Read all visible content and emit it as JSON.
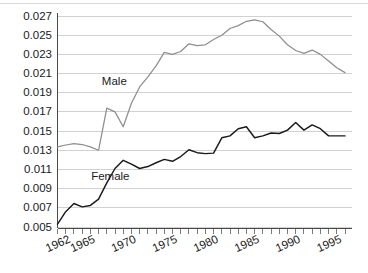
{
  "chart_data": {
    "type": "line",
    "title": "",
    "subtitle": "",
    "xlabel": "",
    "ylabel": "",
    "xlim": [
      1962,
      1997
    ],
    "ylim": [
      0.005,
      0.027
    ],
    "grid": true,
    "legend_position": "inline-annotation",
    "x_tick_labels": [
      "1962",
      "1965",
      "1970",
      "1975",
      "1980",
      "1985",
      "1990",
      "1995"
    ],
    "x_tick_values": [
      1962,
      1965,
      1970,
      1975,
      1980,
      1985,
      1990,
      1995
    ],
    "y_tick_labels": [
      "0.027",
      "0.025",
      "0.023",
      "0.021",
      "0.019",
      "0.017",
      "0.015",
      "0.013",
      "0.011",
      "0.009",
      "0.007",
      "0.005"
    ],
    "y_tick_values": [
      0.027,
      0.025,
      0.023,
      0.021,
      0.019,
      0.017,
      0.015,
      0.013,
      0.011,
      0.009,
      0.007,
      0.005
    ],
    "x": [
      1962,
      1963,
      1964,
      1965,
      1966,
      1967,
      1968,
      1969,
      1970,
      1971,
      1972,
      1973,
      1974,
      1975,
      1976,
      1977,
      1978,
      1979,
      1980,
      1981,
      1982,
      1983,
      1984,
      1985,
      1986,
      1987,
      1988,
      1989,
      1990,
      1991,
      1992,
      1993,
      1994,
      1995,
      1996,
      1997
    ],
    "series": [
      {
        "name": "Male",
        "color": "#8e8e8e",
        "label_x": 1967.4,
        "label_y": 0.0198,
        "values": [
          0.01335,
          0.01355,
          0.0137,
          0.0136,
          0.01335,
          0.013,
          0.0174,
          0.017,
          0.01545,
          0.0179,
          0.0196,
          0.02065,
          0.0218,
          0.0232,
          0.023,
          0.0233,
          0.0241,
          0.0239,
          0.024,
          0.02455,
          0.025,
          0.0257,
          0.026,
          0.02645,
          0.0266,
          0.0264,
          0.0256,
          0.0249,
          0.024,
          0.0234,
          0.0231,
          0.02345,
          0.023,
          0.0223,
          0.0216,
          0.0211
        ]
      },
      {
        "name": "Female",
        "color": "#1a1a1a",
        "label_x": 1966.1,
        "label_y": 0.00985,
        "values": [
          0.0053,
          0.0066,
          0.00745,
          0.0071,
          0.00725,
          0.0079,
          0.0096,
          0.0111,
          0.01195,
          0.01155,
          0.0111,
          0.0113,
          0.0117,
          0.01205,
          0.01185,
          0.01235,
          0.01305,
          0.01275,
          0.01265,
          0.0127,
          0.0143,
          0.0145,
          0.01525,
          0.01545,
          0.0143,
          0.0145,
          0.0148,
          0.01475,
          0.0151,
          0.0159,
          0.0151,
          0.01565,
          0.01525,
          0.0145,
          0.0145,
          0.0145
        ]
      }
    ]
  }
}
